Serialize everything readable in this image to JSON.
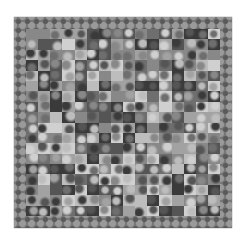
{
  "image": {
    "subject": "grayscale patchwork quilt",
    "background_color": "#ffffff",
    "quilt_bounds": {
      "x": 14,
      "y": 17,
      "width": 218,
      "height": 211
    },
    "border_color": "#777777",
    "palette": [
      "#3a3a3a",
      "#555555",
      "#6e6e6e",
      "#888888",
      "#a2a2a2",
      "#bdbdbd",
      "#d0d0d0"
    ]
  }
}
